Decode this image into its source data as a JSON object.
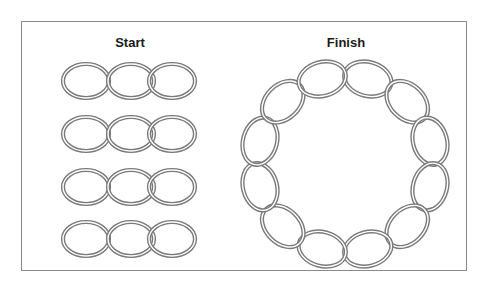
{
  "diagram": {
    "frame_color": "#8a8a8a",
    "link_stroke_outer": "#7a7a7a",
    "link_stroke_inner": "#ffffff",
    "panels": [
      {
        "id": "start",
        "label": "Start",
        "label_pos": [
          130,
          44
        ],
        "description": "Four separate chain segments, each made of three interlocked oval links",
        "segments": [
          {
            "row": 1,
            "links": 3,
            "center_y": 81
          },
          {
            "row": 2,
            "links": 3,
            "center_y": 134
          },
          {
            "row": 3,
            "links": 3,
            "center_y": 187
          },
          {
            "row": 4,
            "links": 3,
            "center_y": 239
          }
        ],
        "link_centers_x": [
          86,
          131,
          172
        ],
        "link_rx": 23,
        "link_ry": 17
      },
      {
        "id": "finish",
        "label": "Finish",
        "label_pos": [
          346,
          44
        ],
        "description": "A single closed circular chain made of twelve interlocked oval links",
        "ring": {
          "center": [
            345,
            164
          ],
          "radius": 88,
          "links": 12,
          "link_rx": 24,
          "link_ry": 17
        }
      }
    ]
  }
}
